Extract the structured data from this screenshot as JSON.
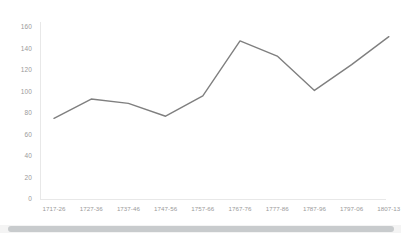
{
  "chart_data": {
    "type": "line",
    "title": "",
    "subtitle": "",
    "xlabel": "",
    "ylabel": "",
    "categories": [
      "1717-26",
      "1727-36",
      "1737-46",
      "1747-56",
      "1757-66",
      "1767-76",
      "1777-86",
      "1787-96",
      "1797-06",
      "1807-13"
    ],
    "values": [
      75,
      93,
      89,
      77,
      96,
      147,
      133,
      101,
      125,
      151
    ],
    "series": [
      {
        "name": "Series 1",
        "values": [
          75,
          93,
          89,
          77,
          96,
          147,
          133,
          101,
          125,
          151
        ],
        "color": "#7f7f7f"
      }
    ],
    "ylim": [
      0,
      160
    ],
    "y_ticks": [
      0,
      20,
      40,
      60,
      80,
      100,
      120,
      140,
      160
    ],
    "y_tick_labels": [
      "0",
      "20",
      "40",
      "60",
      "80",
      "100",
      "120",
      "140",
      "160"
    ],
    "grid": false,
    "legend": "none",
    "markers": false,
    "line_color": "#7f7f7f",
    "line_width": 1.4,
    "axis_color": "#e8e8e8",
    "tick_label_color": "#9a9a9a",
    "background": "#ffffff"
  },
  "scrollbar": {
    "name": "horizontal-scrollbar",
    "thumb_color": "#c8cbcd",
    "track_color": "#f4f4f4"
  }
}
